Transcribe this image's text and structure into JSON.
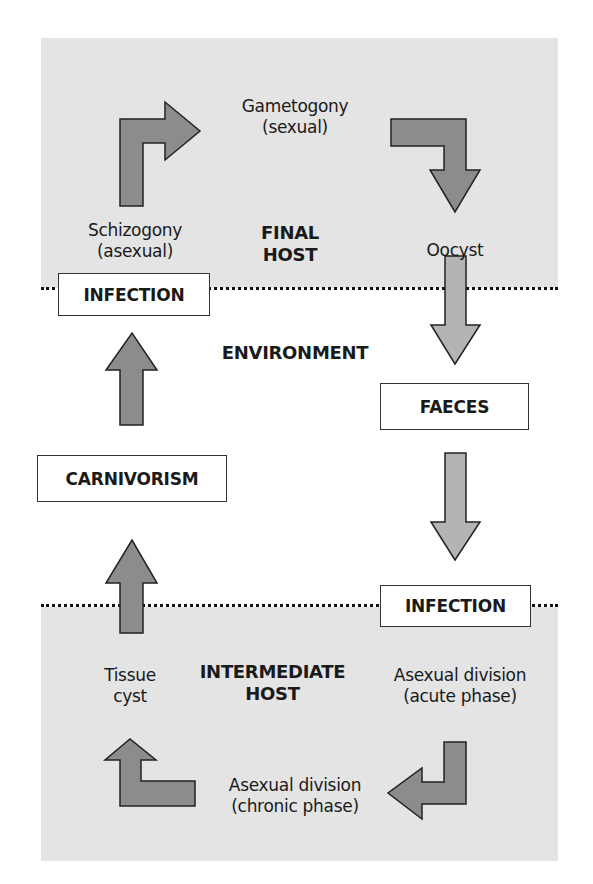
{
  "diagram": {
    "zones": {
      "final_host": {
        "title_line1": "FINAL",
        "title_line2": "HOST"
      },
      "environment": {
        "title": "ENVIRONMENT"
      },
      "intermediate_host": {
        "title_line1": "INTERMEDIATE",
        "title_line2": "HOST"
      }
    },
    "stages": {
      "gametogony": {
        "line1": "Gametogony",
        "line2": "(sexual)"
      },
      "schizogony": {
        "line1": "Schizogony",
        "line2": "(asexual)"
      },
      "oocyst": {
        "line1": "Oocyst"
      },
      "tissue_cyst": {
        "line1": "Tissue",
        "line2": "cyst"
      },
      "asexual_acute": {
        "line1": "Asexual division",
        "line2": "(acute phase)"
      },
      "asexual_chronic": {
        "line1": "Asexual division",
        "line2": "(chronic phase)"
      }
    },
    "boxes": {
      "infection_final": "INFECTION",
      "faeces": "FAECES",
      "carnivorism": "CARNIVORISM",
      "infection_intermediate": "INFECTION"
    },
    "colors": {
      "zone_gray": "#e4e4e4",
      "arrow_dark": "#8c8c8c",
      "arrow_light": "#b4b4b4",
      "stroke": "#222222"
    }
  }
}
